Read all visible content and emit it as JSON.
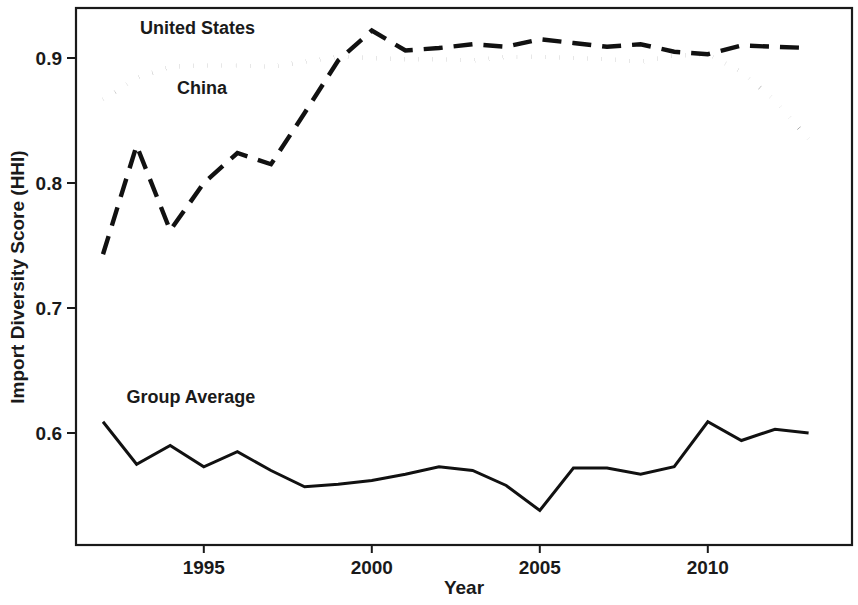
{
  "chart_data": {
    "type": "line",
    "title": "",
    "xlabel": "Year",
    "ylabel": "Import Diversity Score (HHI)",
    "xlim": [
      1992,
      2013
    ],
    "ylim": [
      0.525,
      0.932
    ],
    "grid": false,
    "legend_position": "inline-annotations",
    "x": [
      1992,
      1993,
      1994,
      1995,
      1996,
      1997,
      1998,
      1999,
      2000,
      2001,
      2002,
      2003,
      2004,
      2005,
      2006,
      2007,
      2008,
      2009,
      2010,
      2011,
      2012,
      2013
    ],
    "xticks": [
      1995,
      2000,
      2005,
      2010
    ],
    "xtick_labels": [
      "1995",
      "2000",
      "2005",
      "2010"
    ],
    "yticks": [
      0.6,
      0.7,
      0.8,
      0.9
    ],
    "ytick_labels": [
      "0.6",
      "0.7",
      "0.8",
      "0.9"
    ],
    "series": [
      {
        "name": "United States",
        "style": "dotted",
        "label_x": 1993.1,
        "label_y": 0.919,
        "values": [
          0.867,
          0.884,
          0.893,
          0.894,
          0.894,
          0.893,
          0.897,
          0.901,
          0.9,
          0.899,
          0.899,
          0.898,
          0.901,
          0.901,
          0.9,
          0.899,
          0.897,
          0.902,
          0.903,
          0.889,
          0.866,
          0.835
        ]
      },
      {
        "name": "China",
        "style": "dashed",
        "label_x": 1994.2,
        "label_y": 0.871,
        "values": [
          0.743,
          0.83,
          0.762,
          0.8,
          0.824,
          0.815,
          0.856,
          0.898,
          0.922,
          0.906,
          0.908,
          0.911,
          0.909,
          0.915,
          0.912,
          0.909,
          0.911,
          0.905,
          0.903,
          0.91,
          0.909,
          0.908
        ]
      },
      {
        "name": "Group Average",
        "style": "solid",
        "label_x": 1992.7,
        "label_y": 0.624,
        "values": [
          0.609,
          0.575,
          0.59,
          0.573,
          0.585,
          0.57,
          0.557,
          0.559,
          0.562,
          0.567,
          0.573,
          0.57,
          0.558,
          0.538,
          0.572,
          0.572,
          0.567,
          0.573,
          0.609,
          0.594,
          0.603,
          0.6
        ]
      }
    ]
  },
  "axes": {
    "y_title": "Import Diversity Score (HHI)",
    "x_title": "Year"
  }
}
